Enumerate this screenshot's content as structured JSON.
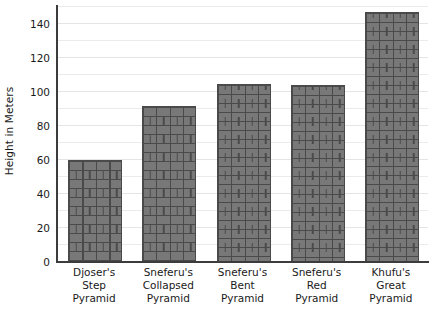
{
  "chart_data": {
    "type": "bar",
    "title": "",
    "subtitle": "",
    "xlabel": "",
    "ylabel": "Height in Meters",
    "categories": [
      "Djoser's\nStep\nPyramid",
      "Sneferu's\nCollapsed\nPyramid",
      "Sneferu's\nBent\nPyramid",
      "Sneferu's\nRed\nPyramid",
      "Khufu's\nGreat\nPyramid"
    ],
    "category_lines": [
      [
        "Djoser's",
        "Step",
        "Pyramid"
      ],
      [
        "Sneferu's",
        "Collapsed",
        "Pyramid"
      ],
      [
        "Sneferu's",
        "Bent",
        "Pyramid"
      ],
      [
        "Sneferu's",
        "Red",
        "Pyramid"
      ],
      [
        "Khufu's",
        "Great",
        "Pyramid"
      ]
    ],
    "values": [
      60,
      92,
      105,
      104,
      147
    ],
    "ylim": [
      0,
      150
    ],
    "ytick_labels": [
      "0",
      "20",
      "40",
      "60",
      "80",
      "100",
      "120",
      "140"
    ],
    "ytick_values": [
      0,
      20,
      40,
      60,
      80,
      100,
      120,
      140
    ],
    "gridline_values": [
      10,
      20,
      30,
      40,
      50,
      60,
      70,
      80,
      90,
      100,
      110,
      120,
      130,
      140,
      150
    ],
    "grid": true,
    "legend": "none",
    "bar_fill_color": "#787878",
    "bar_edge_color": "#4a4a4a",
    "bar_texture": "brick-running-bond",
    "grid_color": "#eceaea",
    "axis_color": "#3c3c3c",
    "text_color": "#1a1a1a",
    "background_color": "#ffffff"
  }
}
